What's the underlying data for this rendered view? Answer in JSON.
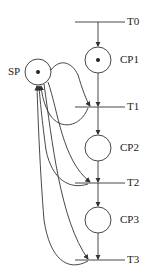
{
  "diagram": {
    "type": "petri-net",
    "places": [
      {
        "id": "SP",
        "label": "SP",
        "tokens": 1
      },
      {
        "id": "CP1",
        "label": "CP1",
        "tokens": 1
      },
      {
        "id": "CP2",
        "label": "CP2",
        "tokens": 0
      },
      {
        "id": "CP3",
        "label": "CP3",
        "tokens": 0
      }
    ],
    "transitions": [
      {
        "id": "T0",
        "label": "T0"
      },
      {
        "id": "T1",
        "label": "T1"
      },
      {
        "id": "T2",
        "label": "T2"
      },
      {
        "id": "T3",
        "label": "T3"
      }
    ],
    "arcs": [
      [
        "T0",
        "CP1"
      ],
      [
        "CP1",
        "T1"
      ],
      [
        "T1",
        "CP2"
      ],
      [
        "CP2",
        "T2"
      ],
      [
        "T2",
        "CP3"
      ],
      [
        "CP3",
        "T3"
      ],
      [
        "SP",
        "T1"
      ],
      [
        "T1",
        "SP"
      ],
      [
        "SP",
        "T2"
      ],
      [
        "T2",
        "SP"
      ],
      [
        "SP",
        "T3"
      ],
      [
        "T3",
        "SP"
      ]
    ],
    "colors": {
      "stroke": "#333333"
    }
  }
}
